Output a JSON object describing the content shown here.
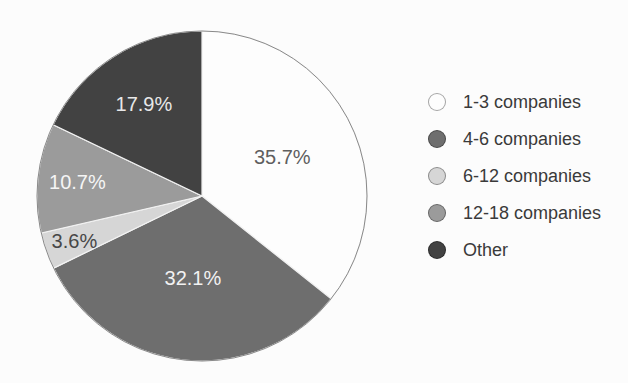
{
  "chart_data": {
    "type": "pie",
    "title": "",
    "labels": [
      "1-3 companies",
      "4-6 companies",
      "6-12 companies",
      "12-18 companies",
      "Other"
    ],
    "values": [
      35.7,
      32.1,
      3.6,
      10.7,
      17.9
    ],
    "value_labels": [
      "35.7%",
      "32.1%",
      "3.6%",
      "10.7%",
      "17.9%"
    ],
    "colors": [
      "#fdfdfd",
      "#6e6e6e",
      "#d6d6d6",
      "#9b9b9b",
      "#424242"
    ],
    "slice_label_colors": [
      "#5f5f5f",
      "#f2f2f2",
      "#474747",
      "#f5f5f5",
      "#e8e8e8"
    ],
    "start_angle_deg": 0,
    "direction": "clockwise",
    "legend_position": "right",
    "layout": {
      "center_x": 202,
      "center_y": 196,
      "radius": 165,
      "label_radius_factors": [
        0.54,
        0.5,
        0.82,
        0.76,
        0.66
      ],
      "slice_label_font_px": 20,
      "outline_color": "#8a8a8a",
      "separator_color": "#f2f2f2"
    }
  }
}
